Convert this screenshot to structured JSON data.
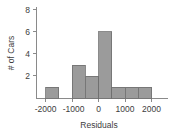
{
  "chart_data": {
    "type": "bar",
    "title": "",
    "subtitle": "",
    "xlabel": "Residuals",
    "ylabel": "# of Cars",
    "xlim": [
      -2250,
      2300
    ],
    "ylim": [
      0,
      8.6
    ],
    "grid": false,
    "legend": null,
    "bin_width": 500,
    "bins": [
      {
        "left": -2000,
        "right": -1500,
        "count": 1
      },
      {
        "left": -1500,
        "right": -1000,
        "count": 0
      },
      {
        "left": -1000,
        "right": -500,
        "count": 3
      },
      {
        "left": -500,
        "right": 0,
        "count": 2
      },
      {
        "left": 0,
        "right": 500,
        "count": 6
      },
      {
        "left": 500,
        "right": 1000,
        "count": 1
      },
      {
        "left": 1000,
        "right": 1500,
        "count": 1
      },
      {
        "left": 1500,
        "right": 2000,
        "count": 1
      }
    ],
    "categories": [
      "-2000 to -1500",
      "-1500 to -1000",
      "-1000 to -500",
      "-500 to 0",
      "0 to 500",
      "500 to 1000",
      "1000 to 1500",
      "1500 to 2000"
    ],
    "values": [
      1,
      0,
      3,
      2,
      6,
      1,
      1,
      1
    ],
    "xticks": [
      {
        "value": -2000,
        "label": "-2000"
      },
      {
        "value": -1000,
        "label": "-1000"
      },
      {
        "value": 0,
        "label": "0"
      },
      {
        "value": 1000,
        "label": "1000"
      },
      {
        "value": 2000,
        "label": "2000"
      }
    ],
    "yticks": [
      {
        "value": 2,
        "label": "2"
      },
      {
        "value": 4,
        "label": "4"
      },
      {
        "value": 6,
        "label": "6"
      },
      {
        "value": 8,
        "label": "8"
      }
    ],
    "colors": {
      "bar_fill": "#9b9b9b",
      "bar_stroke": "#6e6e6e",
      "axis": "#8a8a8a",
      "text": "#3d3d3d",
      "background": "#ffffff"
    }
  }
}
